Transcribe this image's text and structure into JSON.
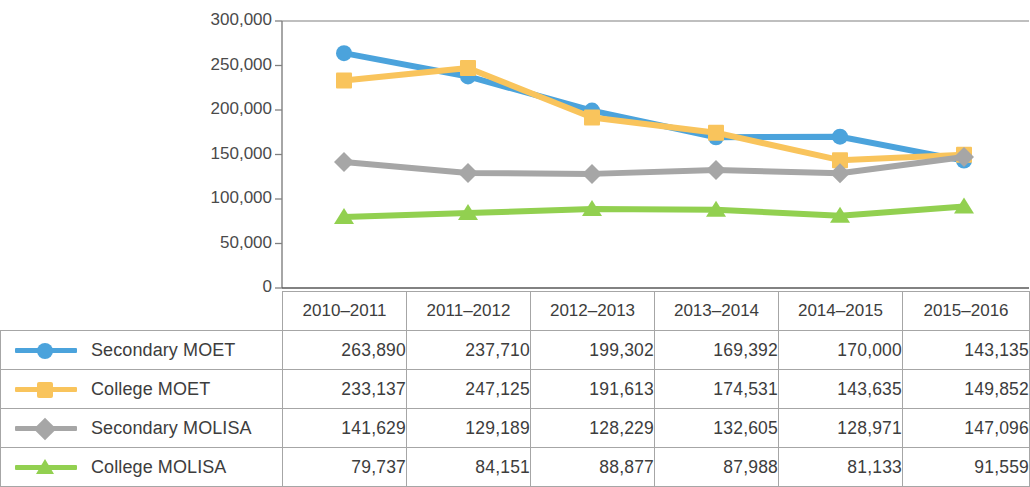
{
  "chart_data": {
    "type": "line",
    "title": "",
    "xlabel": "",
    "ylabel": "",
    "categories": [
      "2010–2011",
      "2011–2012",
      "2012–2013",
      "2013–2014",
      "2014–2015",
      "2015–2016"
    ],
    "ylim": [
      0,
      300000
    ],
    "ytick_values": [
      300000,
      250000,
      200000,
      150000,
      100000,
      50000,
      0
    ],
    "ytick_labels": [
      "300,000",
      "250,000",
      "200,000",
      "150,000",
      "100,000",
      "50,000",
      "0"
    ],
    "grid": false,
    "legend_position": "table-left",
    "series": [
      {
        "name": "Secondary MOET",
        "color": "#4BA3DC",
        "marker": "circle",
        "values": [
          263890,
          237710,
          199302,
          169392,
          170000,
          143135
        ],
        "value_labels": [
          "263,890",
          "237,710",
          "199,302",
          "169,392",
          "170,000",
          "143,135"
        ]
      },
      {
        "name": "College MOET",
        "color": "#F9C45C",
        "marker": "square",
        "values": [
          233137,
          247125,
          191613,
          174531,
          143635,
          149852
        ],
        "value_labels": [
          "233,137",
          "247,125",
          "191,613",
          "174,531",
          "143,635",
          "149,852"
        ]
      },
      {
        "name": "Secondary MOLISA",
        "color": "#A6A6A6",
        "marker": "diamond",
        "values": [
          141629,
          129189,
          128229,
          132605,
          128971,
          147096
        ],
        "value_labels": [
          "141,629",
          "129,189",
          "128,229",
          "132,605",
          "128,971",
          "147,096"
        ]
      },
      {
        "name": "College MOLISA",
        "color": "#92D050",
        "marker": "triangle",
        "values": [
          79737,
          84151,
          88877,
          87988,
          81133,
          91559
        ],
        "value_labels": [
          "79,737",
          "84,151",
          "88,877",
          "87,988",
          "81,133",
          "91,559"
        ]
      }
    ]
  },
  "table": {
    "header_corner": "",
    "columns": [
      "2010–2011",
      "2011–2012",
      "2012–2013",
      "2013–2014",
      "2014–2015",
      "2015–2016"
    ],
    "rows": [
      {
        "label": "Secondary MOET",
        "color": "#4BA3DC",
        "marker": "circle",
        "cells": [
          "263,890",
          "237,710",
          "199,302",
          "169,392",
          "170,000",
          "143,135"
        ]
      },
      {
        "label": "College MOET",
        "color": "#F9C45C",
        "marker": "square",
        "cells": [
          "233,137",
          "247,125",
          "191,613",
          "174,531",
          "143,635",
          "149,852"
        ]
      },
      {
        "label": "Secondary MOLISA",
        "color": "#A6A6A6",
        "marker": "diamond",
        "cells": [
          "141,629",
          "129,189",
          "128,229",
          "132,605",
          "128,971",
          "147,096"
        ]
      },
      {
        "label": "College MOLISA",
        "color": "#92D050",
        "marker": "triangle",
        "cells": [
          "79,737",
          "84,151",
          "88,877",
          "87,988",
          "81,133",
          "91,559"
        ]
      }
    ]
  }
}
